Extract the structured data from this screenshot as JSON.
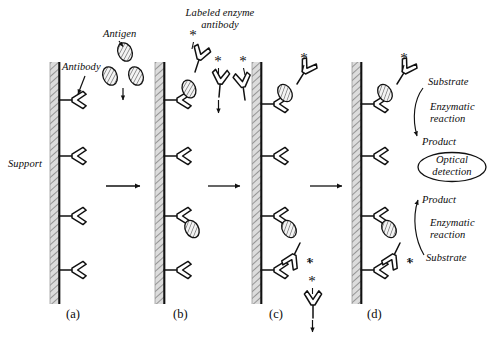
{
  "figure": {
    "background_color": "#ffffff",
    "ink_color": "#111111",
    "support_fill_color": "#d9d9d9",
    "width": 497,
    "height": 337
  },
  "annotations": {
    "support": "Support",
    "antibody": "Antibody",
    "antigen": "Antigen",
    "labeled_enzyme_antibody_line1": "Labeled enzyme",
    "labeled_enzyme_antibody_line2": "antibody",
    "substrate_top": "Substrate",
    "enzymatic_reaction_top_line1": "Enzymatic",
    "enzymatic_reaction_top_line2": "reaction",
    "product_top": "Product",
    "optical_detection_line1": "Optical",
    "optical_detection_line2": "detection",
    "product_bottom": "Product",
    "enzymatic_reaction_bottom_line1": "Enzymatic",
    "enzymatic_reaction_bottom_line2": "reaction",
    "substrate_bottom": "Substrate"
  },
  "panels": [
    {
      "id": "a",
      "label": "(a)",
      "caption": "Antibodies immobilized on support"
    },
    {
      "id": "b",
      "label": "(b)",
      "caption": "Antigen binding and labeled enzyme antibody addition"
    },
    {
      "id": "c",
      "label": "(c)",
      "caption": "Sandwich complex formed, unbound antibody washed away"
    },
    {
      "id": "d",
      "label": "(d)",
      "caption": "Substrate added, enzymatic reaction and optical detection"
    }
  ],
  "panel_contents": {
    "a": {
      "antibodies": 4,
      "antigens_bound": [],
      "labeled_antibodies_bound": []
    },
    "b": {
      "antibodies": 4,
      "antigens_bound": [
        1,
        3
      ],
      "labeled_antibodies_bound": [],
      "free_antigens": 3,
      "free_labeled_antibodies": 3
    },
    "c": {
      "antibodies": 4,
      "antigens_bound": [
        1,
        3
      ],
      "labeled_antibodies_bound": [
        1,
        3
      ],
      "washed_away_labeled_antibodies": 1
    },
    "d": {
      "antibodies": 4,
      "antigens_bound": [
        1,
        3
      ],
      "labeled_antibodies_bound": [
        1,
        3
      ]
    }
  },
  "process_arrows": {
    "count": 3,
    "direction": "right",
    "between": [
      "a-b",
      "b-c",
      "c-d"
    ]
  }
}
